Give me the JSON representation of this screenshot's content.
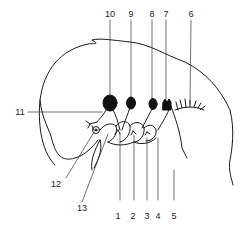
{
  "figure": {
    "type": "anatomical line drawing",
    "colors": {
      "line": "#1a1a1a",
      "ganglion_fill": "#111111",
      "leader": "#333333",
      "background": "#ffffff"
    }
  },
  "labels": {
    "l1": "1",
    "l2": "2",
    "l3": "3",
    "l4": "4",
    "l5": "5",
    "l6": "6",
    "l7": "7",
    "l8": "8",
    "l9": "9",
    "l10": "10",
    "l11": "11",
    "l12": "12",
    "l13": "13"
  }
}
